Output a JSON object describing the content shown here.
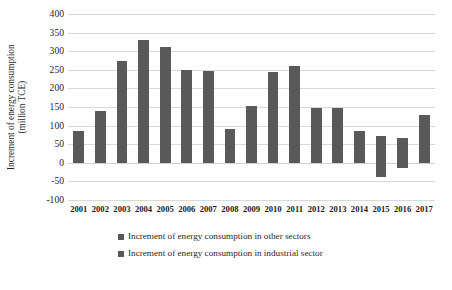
{
  "chart_data": {
    "type": "bar",
    "title": "",
    "xlabel": "",
    "ylabel": "Increment of energy consumption (million TCE)",
    "ylabel_line1": "Increment of energy consumption",
    "ylabel_line2": "(million TCE)",
    "ylim": [
      -100,
      400
    ],
    "ytick_step": 50,
    "yticks": [
      400,
      350,
      300,
      250,
      200,
      150,
      100,
      50,
      0,
      -50,
      -100
    ],
    "ytick_labels": [
      "400",
      "350",
      "300",
      "250",
      "200",
      "150",
      "100",
      "50",
      "0",
      "-50",
      "-100"
    ],
    "grid": true,
    "legend_position": "bottom",
    "categories": [
      "2001",
      "2002",
      "2003",
      "2004",
      "2005",
      "2006",
      "2007",
      "2008",
      "2009",
      "2010",
      "2011",
      "2012",
      "2013",
      "2014",
      "2015",
      "2016",
      "2017"
    ],
    "series": [
      {
        "name": "Increment of energy consumption in other sectors",
        "color": "#595959",
        "values": [
          85,
          140,
          274,
          331,
          310,
          249,
          248,
          91,
          153,
          243,
          261,
          148,
          146,
          86,
          71,
          67,
          128
        ]
      },
      {
        "name": "Increment of energy consumption in industrial sector",
        "color": "#595959",
        "values": [
          0,
          0,
          0,
          0,
          0,
          0,
          0,
          0,
          0,
          0,
          0,
          0,
          0,
          0,
          -37,
          -14,
          0
        ]
      }
    ]
  },
  "legend": {
    "items": [
      {
        "label": "Increment of energy consumption in other sectors",
        "color": "#595959"
      },
      {
        "label": "Increment of energy consumption in industrial sector",
        "color": "#595959"
      }
    ]
  }
}
